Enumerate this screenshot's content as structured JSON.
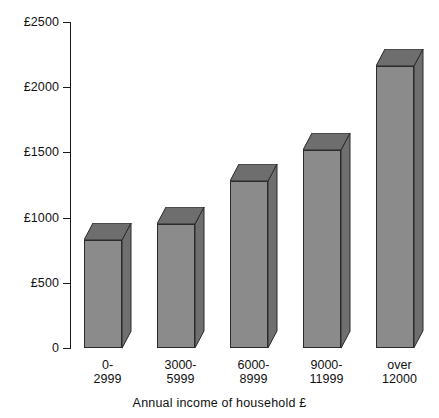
{
  "chart_data": {
    "type": "bar",
    "title": "",
    "subtitle": "",
    "xlabel": "Annual income of household £",
    "ylabel": "",
    "categories": [
      "0-\n2999",
      "3000-\n5999",
      "6000-\n8999",
      "9000-\n11999",
      "over\n12000"
    ],
    "category_lines": [
      [
        "0-",
        "2999"
      ],
      [
        "3000-",
        "5999"
      ],
      [
        "6000-",
        "8999"
      ],
      [
        "9000-",
        "11999"
      ],
      [
        "over",
        "12000"
      ]
    ],
    "values": [
      830,
      950,
      1280,
      1520,
      2160
    ],
    "ylim": [
      0,
      2500
    ],
    "yticks": [
      0,
      500,
      1000,
      1500,
      2000,
      2500
    ],
    "ytick_labels": [
      "0",
      "£500",
      "£1000",
      "£1500",
      "£2000",
      "£2500"
    ],
    "grid": false,
    "legend": null,
    "style": "3d-columns",
    "colors": {
      "bar_front": "#8b8b8b",
      "bar_side": "#6f6f6f",
      "bar_top": "#6e6e6e",
      "outline": "#2b2b2b",
      "axis": "#1a1a1a",
      "text": "#111111",
      "background": "#ffffff"
    }
  },
  "axis": {
    "x_title": "Annual income of household £"
  }
}
